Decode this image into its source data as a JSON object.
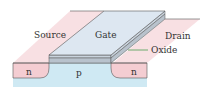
{
  "diagram": {
    "labels": {
      "source": "Source",
      "gate": "Gate",
      "drain": "Drain",
      "oxide": "Oxide",
      "n_left": "n",
      "p_center": "p",
      "n_right": "n"
    },
    "colors": {
      "n_region": "#f4cdd2",
      "p_region": "#cfe9f3",
      "gate_top": "#dde7f1",
      "gate_side": "#c9d3dd",
      "oxide": "#b8c2cc",
      "outline": "#444444",
      "oxide_pointer": "#4aa050"
    }
  }
}
